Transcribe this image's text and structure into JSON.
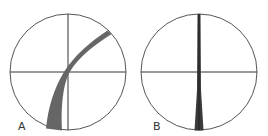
{
  "figure": {
    "panels": [
      {
        "label": "A",
        "cx": 68,
        "cy": 72,
        "r": 58,
        "band": "curved"
      },
      {
        "label": "B",
        "cx": 199,
        "cy": 72,
        "r": 58,
        "band": "straight"
      }
    ],
    "colors": {
      "outline": "#555555",
      "crosshair": "#333333",
      "band": "#666666",
      "band_dark": "#3a3a3a"
    }
  }
}
